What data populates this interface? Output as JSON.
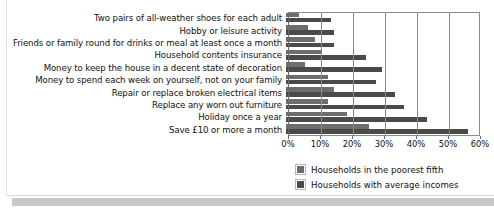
{
  "chart_data": {
    "type": "bar",
    "orientation": "horizontal",
    "title": "",
    "xlabel": "",
    "ylabel": "",
    "xlim": [
      0,
      60
    ],
    "xticks": [
      "0%",
      "10%",
      "20%",
      "30%",
      "40%",
      "50%",
      "60%"
    ],
    "xtick_values": [
      0,
      10,
      20,
      30,
      40,
      50,
      60
    ],
    "grid": true,
    "legend_position": "bottom-right",
    "categories": [
      "Two pairs of all-weather shoes for each adult",
      "Hobby or leisure activity",
      "Friends or family round for drinks or meal at least once a month",
      "Household contents insurance",
      "Money to keep the house in a decent state of decoration",
      "Money to spend each week on yourself, not on your family",
      "Repair or replace broken electrical items",
      "Replace any worn out furniture",
      "Holiday once a year",
      "Save £10 or more a month"
    ],
    "series": [
      {
        "name": "Households in the poorest fifth",
        "color": "#6d6d6d",
        "values": [
          4,
          7,
          9,
          11,
          6,
          13,
          15,
          13,
          19,
          26
        ]
      },
      {
        "name": "Households with average incomes",
        "color": "#4a4a4a",
        "values": [
          14,
          15,
          15,
          25,
          30,
          28,
          34,
          37,
          44,
          57
        ]
      }
    ]
  },
  "legend": {
    "items": [
      {
        "label": "Households in the poorest fifth"
      },
      {
        "label": "Households with average incomes"
      }
    ]
  }
}
